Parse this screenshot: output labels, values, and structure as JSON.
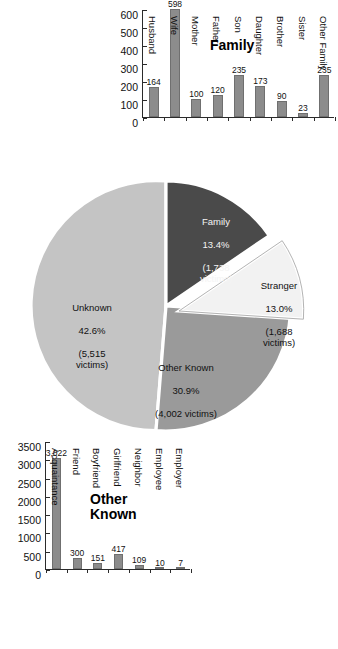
{
  "chart_data": [
    {
      "id": "family-bar",
      "type": "bar",
      "title": "Family",
      "xlabel": "",
      "ylabel": "",
      "ylim": [
        0,
        600
      ],
      "yticks": [
        0,
        100,
        200,
        300,
        400,
        500,
        600
      ],
      "grid": false,
      "legend": "none",
      "bar_color": "#8c8c8c",
      "categories": [
        "Husband",
        "Wife",
        "Mother",
        "Father",
        "Son",
        "Daughter",
        "Brother",
        "Sister",
        "Other Family"
      ],
      "values": [
        164,
        598,
        100,
        120,
        235,
        173,
        90,
        23,
        235
      ],
      "value_labels": [
        "164",
        "598",
        "100",
        "120",
        "235",
        "173",
        "90",
        "23",
        "235"
      ]
    },
    {
      "id": "other-known-bar",
      "type": "bar",
      "title": "Other\nKnown",
      "xlabel": "",
      "ylabel": "",
      "ylim": [
        0,
        3500
      ],
      "yticks": [
        0,
        500,
        1000,
        1500,
        2000,
        2500,
        3000,
        3500
      ],
      "grid": false,
      "legend": "none",
      "bar_color": "#8c8c8c",
      "categories": [
        "Acquaintance",
        "Friend",
        "Boyfriend",
        "Girlfriend",
        "Neighbor",
        "Employee",
        "Employer"
      ],
      "values": [
        3022,
        300,
        151,
        417,
        109,
        10,
        7
      ],
      "value_labels": [
        "3,022",
        "300",
        "151",
        "417",
        "109",
        "10",
        "7"
      ]
    },
    {
      "id": "relationship-pie",
      "type": "pie",
      "title": "",
      "legend": "none",
      "slices": [
        {
          "label": "Family",
          "percent": 13.4,
          "victims": 1738,
          "percent_text": "13.4%",
          "victims_text": "(1,738\nvictims)",
          "color": "#4a4a4a",
          "exploded": false
        },
        {
          "label": "Stranger",
          "percent": 13.0,
          "victims": 1688,
          "percent_text": "13.0%",
          "victims_text": "(1,688\nvictims)",
          "color": "#f2f2f2",
          "exploded": true
        },
        {
          "label": "Other Known",
          "percent": 30.9,
          "victims": 4002,
          "percent_text": "30.9%",
          "victims_text": "(4,002 victims)",
          "color": "#9a9a9a",
          "exploded": false
        },
        {
          "label": "Unknown",
          "percent": 42.6,
          "victims": 5515,
          "percent_text": "42.6%",
          "victims_text": "(5,515\nvictims)",
          "color": "#c4c4c4",
          "exploded": false
        }
      ]
    }
  ],
  "family_chart": {
    "title": "Family",
    "yticks": [
      "0",
      "100",
      "200",
      "300",
      "400",
      "500",
      "600"
    ],
    "bars": [
      {
        "label": "Husband",
        "value_label": "164"
      },
      {
        "label": "Wife",
        "value_label": "598"
      },
      {
        "label": "Mother",
        "value_label": "100"
      },
      {
        "label": "Father",
        "value_label": "120"
      },
      {
        "label": "Son",
        "value_label": "235"
      },
      {
        "label": "Daughter",
        "value_label": "173"
      },
      {
        "label": "Brother",
        "value_label": "90"
      },
      {
        "label": "Sister",
        "value_label": "23"
      },
      {
        "label": "Other Family",
        "value_label": "235"
      }
    ]
  },
  "other_known_chart": {
    "title": "Other\nKnown",
    "yticks": [
      "0",
      "500",
      "1000",
      "1500",
      "2000",
      "2500",
      "3000",
      "3500"
    ],
    "bars": [
      {
        "label": "Acquaintance",
        "value_label": "3,022"
      },
      {
        "label": "Friend",
        "value_label": "300"
      },
      {
        "label": "Boyfriend",
        "value_label": "151"
      },
      {
        "label": "Girlfriend",
        "value_label": "417"
      },
      {
        "label": "Neighbor",
        "value_label": "109"
      },
      {
        "label": "Employee",
        "value_label": "10"
      },
      {
        "label": "Employer",
        "value_label": "7"
      }
    ]
  },
  "pie": {
    "family": {
      "label": "Family",
      "percent": "13.4%",
      "victims": "(1,738\nvictims)"
    },
    "stranger": {
      "label": "Stranger",
      "percent": "13.0%",
      "victims": "(1,688\nvictims)"
    },
    "other_known": {
      "label": "Other Known",
      "percent": "30.9%",
      "victims": "(4,002 victims)"
    },
    "unknown": {
      "label": "Unknown",
      "percent": "42.6%",
      "victims": "(5,515\nvictims)"
    }
  },
  "colors": {
    "family": "#4a4a4a",
    "stranger": "#f2f2f2",
    "other_known": "#9a9a9a",
    "unknown": "#c4c4c4",
    "bar": "#8c8c8c",
    "axis": "#2b2b2b"
  }
}
